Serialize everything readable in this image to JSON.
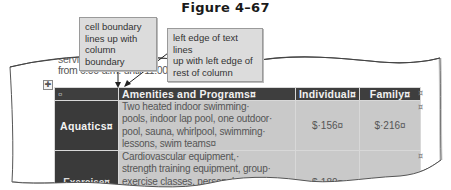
{
  "figure": {
    "title": "Figure 4–67"
  },
  "callouts": [
    {
      "lines": [
        "cell boundary",
        "lines up with",
        "column boundary"
      ]
    },
    {
      "lines": [
        "left edge of text lines",
        "up with left edge of",
        "rest of column"
      ]
    }
  ],
  "document": {
    "partial_top_line": "services. In",
    "partial_top_line_mid": "bar. In",
    "partial_top_line_right": "a wee",
    "line": "from 6:00·a.m.·until·11:00·p.m.¶",
    "move_handle_icon": "✚"
  },
  "table": {
    "headers": [
      "¤",
      "Amenities and Programs¤",
      "Individual¤",
      "Family¤"
    ],
    "rows": [
      {
        "label": "Aquatics¤",
        "description": [
          "Two heated indoor swimming·",
          "pools, indoor lap pool, one outdoor·",
          "pool, sauna, whirlpool, swimming·",
          "lessons, swim teams¤"
        ],
        "individual": "$·156¤",
        "family": "$·216¤"
      },
      {
        "label": "Exercise¤",
        "description": [
          "Cardiovascular equipment,·",
          "strength training equipment, group·",
          "exercise classes, personal"
        ],
        "individual": "$·180¤",
        "family": "$·252¤"
      }
    ],
    "end_of_row_mark": "¤"
  }
}
